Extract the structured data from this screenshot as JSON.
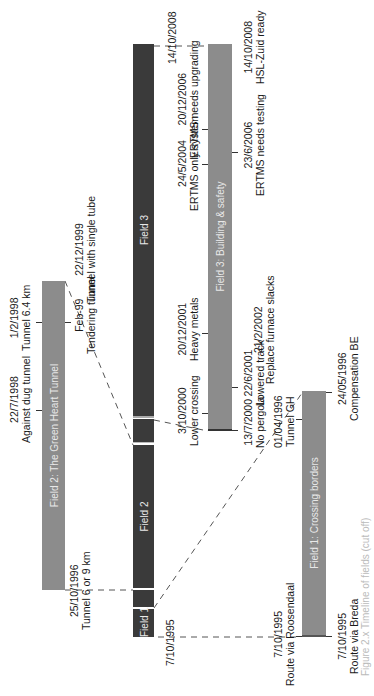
{
  "figure": {
    "orientation": "rotated-90-ccw",
    "caption_fragment": "Figure 2.x  Timeline of fields (cut off)"
  },
  "colors": {
    "field_bar_dark": "#3a3a3a",
    "sub_bar_gray": "#8c8c8c",
    "text": "#1a1a1a",
    "dash_line": "#555555"
  },
  "fields": [
    {
      "id": "field1",
      "label": "Field 1"
    },
    {
      "id": "field2",
      "label": "Field 2"
    },
    {
      "id": "field3",
      "label": "Field 3"
    }
  ],
  "sub_bars": [
    {
      "id": "green-heart",
      "label": "Field 2: The Green Heart Tunnel"
    },
    {
      "id": "building-safety",
      "label": "Field 3: Building & safety"
    },
    {
      "id": "crossing-borders",
      "label": "Field 1: Crossing borders"
    }
  ],
  "main_axis_dates": {
    "start": "7/10/1995",
    "field2_start": "25/10/1996",
    "field3_start": "3/10/2000",
    "end": "14/10/2008"
  },
  "annotations": {
    "green_heart_above": [
      {
        "date": "22/7/1998",
        "text": "Against dug tunnel"
      },
      {
        "date": "1/2/1998",
        "text": "Tunnel 6.4 km"
      }
    ],
    "green_heart_below": [
      {
        "date": "25/10/1996",
        "text": "Tunnel 6 or 9 km"
      },
      {
        "date": "Feb-99",
        "text": "Tendering tunnel"
      },
      {
        "date": "22/12/1999",
        "text": "Tunnel with single tube"
      }
    ],
    "field3_above": [
      {
        "date": "3/10/2000",
        "text": "Lower crossing"
      },
      {
        "date": "20/12/2001",
        "text": "Heavy metals"
      },
      {
        "date": "24/5/2004",
        "text": "ERTMS only system"
      },
      {
        "date": "20/12/2006",
        "text": "ERTMS needs upgrading"
      },
      {
        "date": "14/10/2008",
        "text": ""
      }
    ],
    "field3_below": [
      {
        "date": "13/7/2000",
        "text": "No pergola"
      },
      {
        "date": "22/6/2001",
        "text": "Lowered track"
      },
      {
        "date": "21/2/2002",
        "text": "Replace furnace slacks"
      },
      {
        "date": "23/6/2006",
        "text": "ERTMS needs testing"
      },
      {
        "date": "14/10/2008",
        "text": "HSL-Zuid ready"
      }
    ],
    "field1_above": [
      {
        "date": "7/10/1995",
        "text": "Route via Roosendaal"
      },
      {
        "date": "01/04/1996",
        "text": "Tunnel GH"
      }
    ],
    "field1_below": [
      {
        "date": "7/10/1995",
        "text": "Route via Breda"
      },
      {
        "date": "24/05/1996",
        "text": "Compensation BE"
      }
    ],
    "main_bar_below": [
      {
        "date": "7/10/1995",
        "text": ""
      }
    ]
  }
}
